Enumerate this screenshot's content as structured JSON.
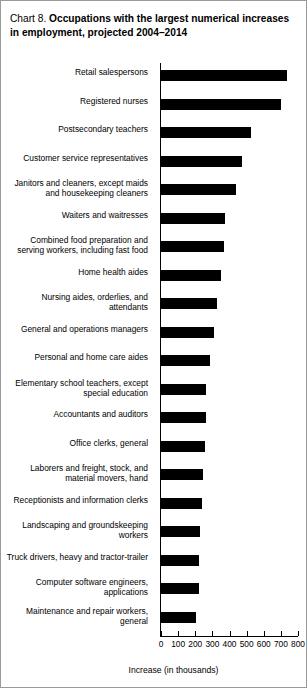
{
  "chart_label": "Chart 8.",
  "title": "Occupations with the largest numerical increases in employment, projected 2004–2014",
  "chart_data": {
    "type": "bar",
    "orientation": "horizontal",
    "title": "Chart 8. Occupations with the largest numerical increases in employment, projected 2004–2014",
    "xlabel": "Increase (in thousands)",
    "ylabel": "",
    "xlim": [
      0,
      800
    ],
    "xticks": [
      0,
      100,
      200,
      300,
      400,
      500,
      600,
      700,
      800
    ],
    "xtick_labels": [
      "0",
      "100",
      "200",
      "300",
      "400",
      "500",
      "600",
      "700",
      "800"
    ],
    "grid": false,
    "legend": false,
    "bar_color": "#000000",
    "categories": [
      "Retail salespersons",
      "Registered nurses",
      "Postsecondary teachers",
      "Customer service representatives",
      "Janitors and cleaners, except maids\nand housekeeping cleaners",
      "Waiters and waitresses",
      "Combined food preparation and\nserving workers, including fast food",
      "Home health aides",
      "Nursing aides, orderlies, and\nattendants",
      "General and operations managers",
      "Personal and home care aides",
      "Elementary school teachers, except\nspecial education",
      "Accountants and auditors",
      "Office clerks, general",
      "Laborers and freight, stock, and\nmaterial movers, hand",
      "Receptionists and information clerks",
      "Landscaping and groundskeeping\nworkers",
      "Truck drivers, heavy and tractor-trailer",
      "Computer software engineers,\napplications",
      "Maintenance and repair workers,\ngeneral"
    ],
    "values": [
      736,
      703,
      524,
      471,
      440,
      376,
      367,
      350,
      325,
      308,
      287,
      265,
      264,
      255,
      248,
      238,
      230,
      223,
      222,
      202
    ]
  }
}
